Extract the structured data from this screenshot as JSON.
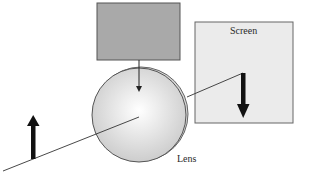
{
  "diagram": {
    "title": "",
    "labels": {
      "screen": "Screen",
      "lens": "Lens"
    },
    "elements": {
      "gray_box": {
        "x": 97,
        "y": 3,
        "width": 83,
        "height": 57,
        "fill": "#a9a9a9",
        "stroke": "#555555"
      },
      "screen": {
        "x": 195,
        "y": 22,
        "width": 98,
        "height": 101,
        "fill": "#ebebeb",
        "stroke": "#666666"
      },
      "lens": {
        "cx": 139,
        "cy": 115,
        "r": 47,
        "fill_center": "#ffffff",
        "fill_edge": "#cfcfcf",
        "stroke": "#555555"
      },
      "object_arrow": {
        "x": 33,
        "y_base": 158,
        "y_tip": 116,
        "direction": "up",
        "color": "#111111"
      },
      "image_arrow": {
        "x": 243,
        "y_base": 73,
        "y_tip": 118,
        "direction": "down",
        "color": "#111111"
      },
      "source_arrow": {
        "x": 139,
        "y_start": 60,
        "y_end": 91,
        "direction": "down",
        "color": "#222222"
      },
      "ray_segments": [
        {
          "x1": 3,
          "y1": 171,
          "x2": 139,
          "y2": 117
        },
        {
          "x1": 187,
          "y1": 97,
          "x2": 243,
          "y2": 73
        }
      ]
    },
    "colors": {
      "background": "#ffffff",
      "line": "#333333"
    }
  }
}
